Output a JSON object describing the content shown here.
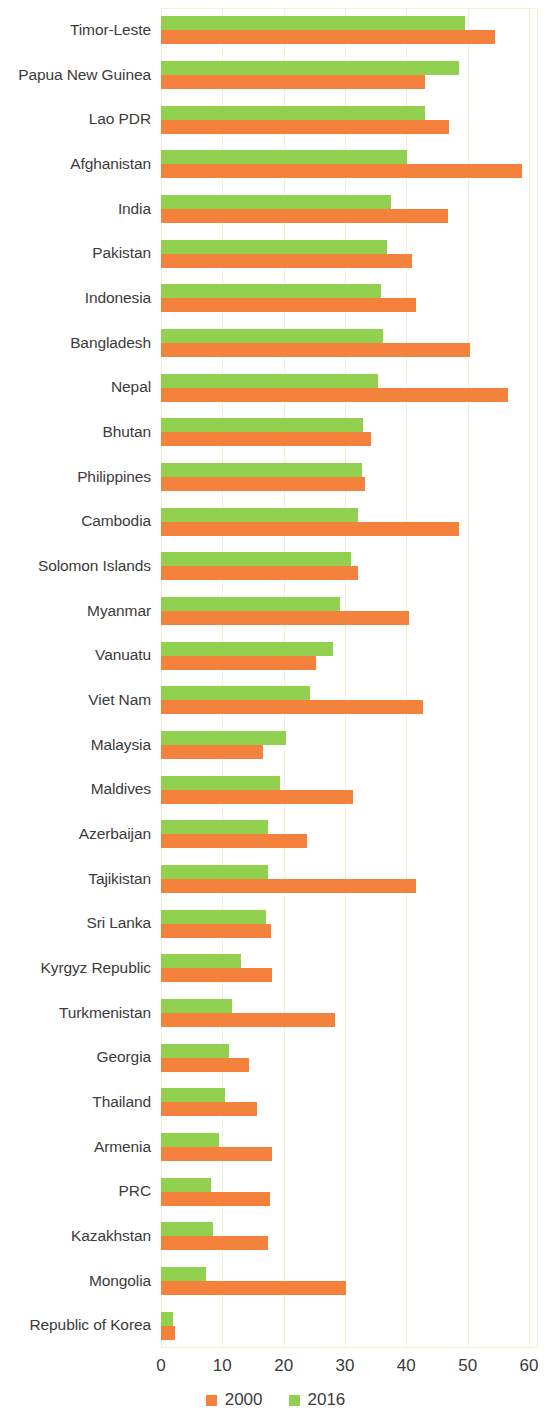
{
  "chart_data": {
    "type": "bar",
    "orientation": "horizontal",
    "title": "",
    "subtitle": "",
    "xlabel": "",
    "ylabel": "",
    "xlim": [
      0,
      60
    ],
    "xticks": [
      0,
      10,
      20,
      30,
      40,
      50,
      60
    ],
    "xtick_labels": [
      "0",
      "10",
      "20",
      "30",
      "40",
      "50",
      "60"
    ],
    "grid": true,
    "grid_axis": "x",
    "legend_position": "bottom",
    "colors": {
      "2000": "#f4823c",
      "2016": "#92d050",
      "grid": "#f2f2d9",
      "text": "#3b3b3b",
      "background": "#ffffff"
    },
    "categories": [
      "Timor-Leste",
      "Papua New Guinea",
      "Lao PDR",
      "Afghanistan",
      "India",
      "Pakistan",
      "Indonesia",
      "Bangladesh",
      "Nepal",
      "Bhutan",
      "Philippines",
      "Cambodia",
      "Solomon Islands",
      "Myanmar",
      "Vanuatu",
      "Viet Nam",
      "Malaysia",
      "Maldives",
      "Azerbaijan",
      "Tajikistan",
      "Sri Lanka",
      "Kyrgyz Republic",
      "Turkmenistan",
      "Georgia",
      "Thailand",
      "Armenia",
      "PRC",
      "Kazakhstan",
      "Mongolia",
      "Republic of Korea"
    ],
    "series": [
      {
        "name": "2000",
        "color": "#f4823c",
        "values": [
          54.5,
          43.0,
          47.0,
          58.9,
          46.8,
          41.0,
          41.6,
          50.4,
          56.5,
          34.3,
          33.2,
          48.6,
          32.2,
          40.4,
          25.2,
          42.7,
          16.7,
          31.3,
          23.8,
          41.6,
          18.0,
          18.1,
          28.3,
          14.4,
          15.6,
          18.1,
          17.8,
          17.4,
          30.1,
          2.3
        ],
        "unit": ""
      },
      {
        "name": "2016",
        "color": "#92d050",
        "values": [
          49.6,
          48.6,
          43.0,
          40.1,
          37.5,
          36.8,
          35.9,
          36.2,
          35.4,
          33.0,
          32.8,
          32.1,
          30.9,
          29.2,
          28.0,
          24.3,
          20.4,
          19.4,
          17.5,
          17.4,
          17.1,
          13.0,
          11.5,
          11.1,
          10.5,
          9.4,
          8.1,
          8.4,
          7.4,
          1.9
        ],
        "unit": ""
      }
    ]
  },
  "legend": {
    "items": [
      {
        "label": "2000",
        "color": "#f4823c"
      },
      {
        "label": "2016",
        "color": "#92d050"
      }
    ]
  }
}
